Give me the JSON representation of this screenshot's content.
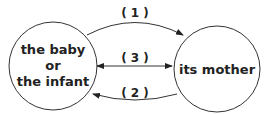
{
  "diagram": {
    "nodes": [
      {
        "id": "baby",
        "lines": [
          "the baby",
          "or",
          "the infant"
        ]
      },
      {
        "id": "mother",
        "lines": [
          "its mother"
        ]
      }
    ],
    "edges": [
      {
        "label": "( 1 )",
        "from": "baby",
        "to": "mother",
        "direction": "forward"
      },
      {
        "label": "( 3 )",
        "from": "baby",
        "to": "mother",
        "direction": "both"
      },
      {
        "label": "( 2 )",
        "from": "mother",
        "to": "baby",
        "direction": "forward"
      }
    ]
  }
}
